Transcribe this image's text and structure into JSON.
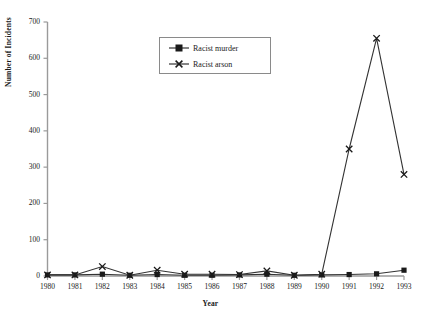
{
  "chart_data": {
    "type": "line",
    "title": "",
    "xlabel": "Year",
    "ylabel": "Number of Incidents",
    "x": [
      1980,
      1981,
      1982,
      1983,
      1984,
      1985,
      1986,
      1987,
      1988,
      1989,
      1990,
      1991,
      1992,
      1993
    ],
    "categories": [
      "1980",
      "1981",
      "1982",
      "1983",
      "1984",
      "1985",
      "1986",
      "1987",
      "1988",
      "1989",
      "1990",
      "1991",
      "1992",
      "1993"
    ],
    "series": [
      {
        "name": "Racist murder",
        "marker": "filled-square",
        "values": [
          3,
          3,
          5,
          2,
          4,
          2,
          2,
          3,
          5,
          2,
          3,
          4,
          6,
          16
        ]
      },
      {
        "name": "Racist arson",
        "marker": "cross",
        "values": [
          3,
          3,
          26,
          2,
          16,
          5,
          5,
          4,
          14,
          2,
          5,
          350,
          655,
          280
        ]
      }
    ],
    "ylim": [
      0,
      700
    ],
    "yticks": [
      0,
      100,
      200,
      300,
      400,
      500,
      600,
      700
    ],
    "ytick_labels": [
      "0",
      "100",
      "200",
      "300",
      "400",
      "500",
      "600",
      "700"
    ],
    "xlim": [
      1980,
      1993
    ],
    "grid": false,
    "legend_position": "top-center",
    "legend_entries": [
      "Racist murder",
      "Racist arson"
    ]
  },
  "style": {
    "line_color": "#333333",
    "axis_color": "#9a9a9a",
    "text_color": "#1a1a1a",
    "background": "#ffffff",
    "legend_border": "#8a8a8a"
  }
}
